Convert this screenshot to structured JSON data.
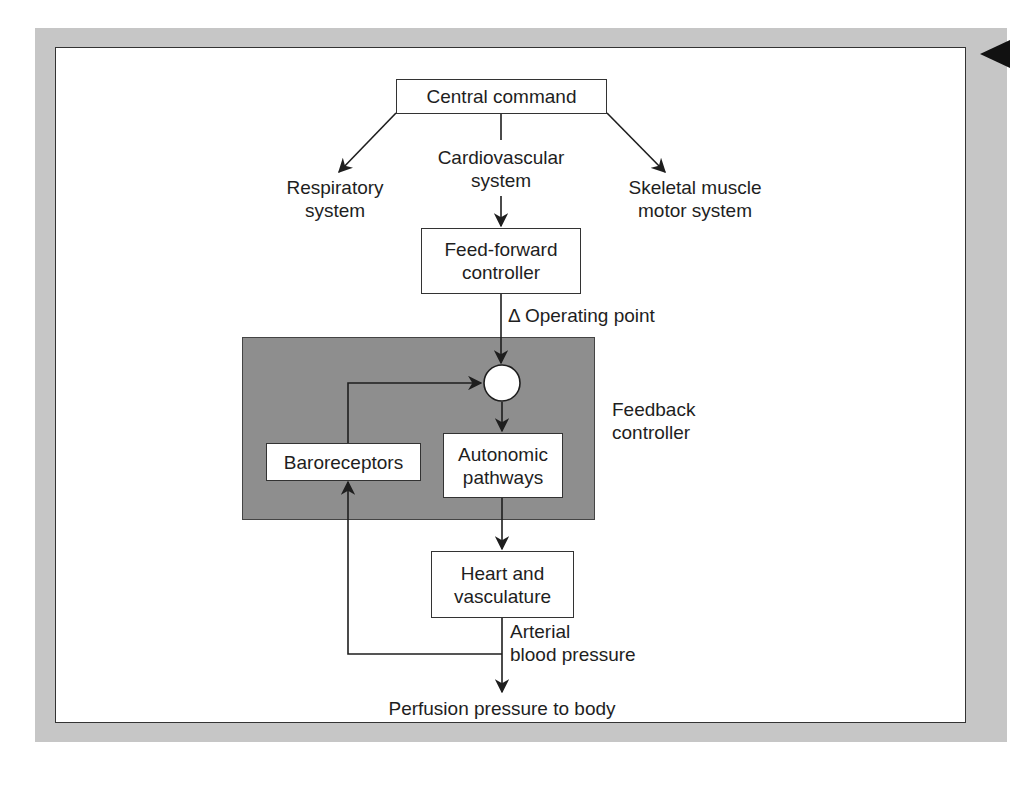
{
  "figure": {
    "top_node": {
      "label": "Central command"
    },
    "branches": [
      {
        "id": "respiratory",
        "label": "Respiratory\nsystem"
      },
      {
        "id": "cardiovascular",
        "label": "Cardiovascular\nsystem"
      },
      {
        "id": "skeletal",
        "label": "Skeletal muscle\nmotor system"
      }
    ],
    "feed_forward": {
      "label": "Feed-forward\ncontroller"
    },
    "operating_point": {
      "label": "Δ Operating point"
    },
    "feedback_controller": {
      "region_label": "Feedback\ncontroller",
      "baroreceptors": "Baroreceptors",
      "autonomic": "Autonomic\npathways"
    },
    "heart": {
      "label": "Heart and\nvasculature"
    },
    "arterial": {
      "label": "Arterial\nblood pressure"
    },
    "output": {
      "label": "Perfusion pressure to body"
    }
  },
  "colors": {
    "frame": "#c6c6c6",
    "feedback_region": "#8e8e8e",
    "line": "#1e1e1e"
  }
}
